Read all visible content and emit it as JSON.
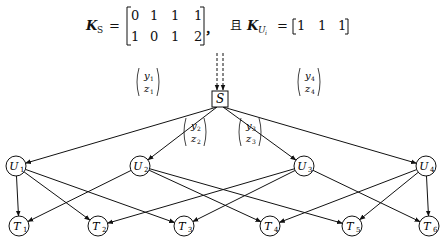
{
  "formula": {
    "ks_label": "K",
    "ks_sub": "S",
    "equals": "=",
    "ks_matrix": [
      [
        "0",
        "1",
        "1",
        "1"
      ],
      [
        "1",
        "0",
        "1",
        "2"
      ]
    ],
    "separator": "，",
    "conj": "且",
    "ku_label": "K",
    "ku_sub": "U",
    "ku_subsub": "i",
    "ku_matrix": [
      "1",
      "1",
      "1"
    ]
  },
  "diagram": {
    "source": {
      "label": "S",
      "x": 220,
      "y": 99
    },
    "edge_labels": [
      {
        "top": "y",
        "top_sub": "1",
        "bottom": "z",
        "bottom_sub": "1",
        "x": 148,
        "y": 82
      },
      {
        "top": "y",
        "top_sub": "2",
        "bottom": "z",
        "bottom_sub": "2",
        "x": 195,
        "y": 132
      },
      {
        "top": "y",
        "top_sub": "3",
        "bottom": "z",
        "bottom_sub": "3",
        "x": 250,
        "y": 132
      },
      {
        "top": "y",
        "top_sub": "4",
        "bottom": "z",
        "bottom_sub": "4",
        "x": 309,
        "y": 82
      }
    ],
    "users": [
      {
        "label": "U",
        "sub": "1",
        "x": 16,
        "y": 166
      },
      {
        "label": "U",
        "sub": "2",
        "x": 140,
        "y": 166
      },
      {
        "label": "U",
        "sub": "3",
        "x": 304,
        "y": 166
      },
      {
        "label": "U",
        "sub": "4",
        "x": 426,
        "y": 166
      }
    ],
    "targets": [
      {
        "label": "T",
        "sub": "1",
        "x": 19,
        "y": 226
      },
      {
        "label": "T",
        "sub": "2",
        "x": 98,
        "y": 226
      },
      {
        "label": "T",
        "sub": "3",
        "x": 184,
        "y": 226
      },
      {
        "label": "T",
        "sub": "4",
        "x": 270,
        "y": 226
      },
      {
        "label": "T",
        "sub": "5",
        "x": 352,
        "y": 226
      },
      {
        "label": "T",
        "sub": "6",
        "x": 429,
        "y": 226
      }
    ],
    "user_target_edges": [
      [
        0,
        0
      ],
      [
        0,
        1
      ],
      [
        0,
        2
      ],
      [
        1,
        0
      ],
      [
        1,
        3
      ],
      [
        1,
        4
      ],
      [
        2,
        1
      ],
      [
        2,
        2
      ],
      [
        2,
        5
      ],
      [
        3,
        3
      ],
      [
        3,
        4
      ],
      [
        3,
        5
      ]
    ]
  }
}
